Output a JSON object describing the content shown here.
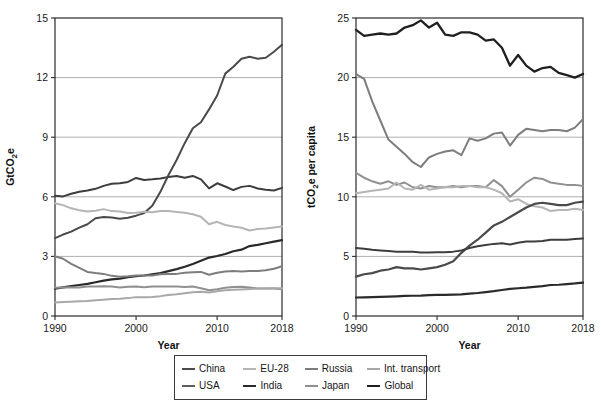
{
  "figure": {
    "background": "#ffffff",
    "panel_count": 2
  },
  "legend": {
    "position": "bottom-center",
    "rows": [
      [
        {
          "label": "China",
          "color": "#4a4a4a",
          "swatch": "line-swatch"
        },
        {
          "label": "EU-28",
          "color": "#b5b5b5",
          "swatch": "line-swatch"
        },
        {
          "label": "Russia",
          "color": "#7d7d7d",
          "swatch": "line-swatch"
        },
        {
          "label": "Int. transport",
          "color": "#a8a8a8",
          "swatch": "line-swatch"
        }
      ],
      [
        {
          "label": "USA",
          "color": "#5e5e5e",
          "swatch": "line-swatch"
        },
        {
          "label": "India",
          "color": "#2a2a2a",
          "swatch": "line-swatch"
        },
        {
          "label": "Japan",
          "color": "#909090",
          "swatch": "line-swatch"
        },
        {
          "label": "Global",
          "color": "#1e1e1e",
          "swatch": "line-swatch"
        }
      ]
    ]
  },
  "chart_data": [
    {
      "panel": "left",
      "type": "line",
      "title": "",
      "xlabel": "Year",
      "ylabel": "GtCO2e",
      "ylabel_display": "GtCO₂e",
      "xlim": [
        1990,
        2018
      ],
      "ylim": [
        0,
        15
      ],
      "yticks": [
        0,
        3,
        6,
        9,
        12,
        15
      ],
      "xticks": [
        1990,
        2000,
        2010,
        2018
      ],
      "grid": "horizontal",
      "legend_position": "below-figure",
      "x": [
        1990,
        1991,
        1992,
        1993,
        1994,
        1995,
        1996,
        1997,
        1998,
        1999,
        2000,
        2001,
        2002,
        2003,
        2004,
        2005,
        2006,
        2007,
        2008,
        2009,
        2010,
        2011,
        2012,
        2013,
        2014,
        2015,
        2016,
        2017,
        2018
      ],
      "series": [
        {
          "name": "USA",
          "color": "#3d3d3d",
          "width": 2.0,
          "values": [
            6.05,
            6.02,
            6.15,
            6.25,
            6.32,
            6.4,
            6.55,
            6.66,
            6.68,
            6.75,
            6.95,
            6.85,
            6.88,
            6.92,
            7.0,
            7.05,
            6.96,
            7.05,
            6.88,
            6.42,
            6.68,
            6.52,
            6.34,
            6.5,
            6.55,
            6.42,
            6.35,
            6.32,
            6.45
          ]
        },
        {
          "name": "China",
          "color": "#4a4a4a",
          "width": 2.0,
          "values": [
            3.92,
            4.1,
            4.25,
            4.45,
            4.62,
            4.92,
            4.98,
            4.96,
            4.9,
            4.95,
            5.05,
            5.18,
            5.55,
            6.25,
            7.1,
            7.85,
            8.7,
            9.45,
            9.75,
            10.4,
            11.1,
            12.2,
            12.55,
            12.95,
            13.05,
            12.95,
            13.0,
            13.3,
            13.65
          ]
        },
        {
          "name": "EU-28",
          "color": "#b5b5b5",
          "width": 2.0,
          "values": [
            5.68,
            5.58,
            5.42,
            5.32,
            5.26,
            5.3,
            5.38,
            5.28,
            5.26,
            5.18,
            5.2,
            5.25,
            5.22,
            5.28,
            5.28,
            5.24,
            5.2,
            5.12,
            5.0,
            4.62,
            4.74,
            4.58,
            4.5,
            4.44,
            4.3,
            4.38,
            4.4,
            4.46,
            4.5
          ]
        },
        {
          "name": "India",
          "color": "#2a2a2a",
          "width": 2.2,
          "values": [
            1.38,
            1.44,
            1.5,
            1.56,
            1.62,
            1.7,
            1.78,
            1.84,
            1.88,
            1.96,
            2.0,
            2.04,
            2.1,
            2.16,
            2.26,
            2.36,
            2.48,
            2.62,
            2.78,
            2.94,
            3.02,
            3.12,
            3.26,
            3.34,
            3.52,
            3.58,
            3.66,
            3.74,
            3.82
          ]
        },
        {
          "name": "Russia",
          "color": "#7d7d7d",
          "width": 2.0,
          "values": [
            3.0,
            2.88,
            2.62,
            2.42,
            2.22,
            2.16,
            2.12,
            2.02,
            1.98,
            2.0,
            2.04,
            2.04,
            2.04,
            2.1,
            2.12,
            2.12,
            2.18,
            2.2,
            2.22,
            2.08,
            2.18,
            2.24,
            2.26,
            2.24,
            2.26,
            2.26,
            2.3,
            2.38,
            2.5
          ]
        },
        {
          "name": "Japan",
          "color": "#909090",
          "width": 2.0,
          "values": [
            1.42,
            1.44,
            1.45,
            1.44,
            1.49,
            1.49,
            1.5,
            1.49,
            1.44,
            1.47,
            1.48,
            1.45,
            1.48,
            1.49,
            1.48,
            1.48,
            1.46,
            1.48,
            1.4,
            1.3,
            1.35,
            1.42,
            1.46,
            1.47,
            1.43,
            1.39,
            1.38,
            1.38,
            1.35
          ]
        },
        {
          "name": "Int. transport",
          "color": "#a8a8a8",
          "width": 2.0,
          "values": [
            0.68,
            0.7,
            0.72,
            0.74,
            0.76,
            0.79,
            0.82,
            0.85,
            0.87,
            0.9,
            0.95,
            0.94,
            0.96,
            1.0,
            1.06,
            1.1,
            1.15,
            1.2,
            1.22,
            1.18,
            1.25,
            1.3,
            1.32,
            1.34,
            1.36,
            1.38,
            1.39,
            1.4,
            1.4
          ]
        }
      ]
    },
    {
      "panel": "right",
      "type": "line",
      "title": "",
      "xlabel": "Year",
      "ylabel": "tCO2e per capita",
      "ylabel_display": "tCO₂e per capita",
      "xlim": [
        1990,
        2018
      ],
      "ylim": [
        0,
        25
      ],
      "yticks": [
        0,
        5,
        10,
        15,
        20,
        25
      ],
      "xticks": [
        1990,
        2000,
        2010,
        2018
      ],
      "grid": "horizontal",
      "legend_position": "below-figure",
      "x": [
        1990,
        1991,
        1992,
        1993,
        1994,
        1995,
        1996,
        1997,
        1998,
        1999,
        2000,
        2001,
        2002,
        2003,
        2004,
        2005,
        2006,
        2007,
        2008,
        2009,
        2010,
        2011,
        2012,
        2013,
        2014,
        2015,
        2016,
        2017,
        2018
      ],
      "series": [
        {
          "name": "USA",
          "color": "#1f1f1f",
          "width": 2.3,
          "values": [
            24.0,
            23.5,
            23.6,
            23.7,
            23.6,
            23.7,
            24.2,
            24.4,
            24.8,
            24.2,
            24.6,
            23.6,
            23.5,
            23.8,
            23.8,
            23.6,
            23.1,
            23.2,
            22.5,
            21.0,
            21.9,
            21.0,
            20.5,
            20.8,
            20.9,
            20.4,
            20.2,
            20.0,
            20.3
          ]
        },
        {
          "name": "Russia",
          "color": "#7d7d7d",
          "width": 2.0,
          "values": [
            20.3,
            19.9,
            18.0,
            16.4,
            14.8,
            14.2,
            13.6,
            12.9,
            12.5,
            13.3,
            13.6,
            13.8,
            13.9,
            13.5,
            14.9,
            14.7,
            14.9,
            15.3,
            15.4,
            14.3,
            15.2,
            15.7,
            15.6,
            15.5,
            15.6,
            15.6,
            15.5,
            15.8,
            16.5
          ]
        },
        {
          "name": "Japan",
          "color": "#909090",
          "width": 2.0,
          "values": [
            12.0,
            11.6,
            11.3,
            11.1,
            11.3,
            11.0,
            11.2,
            10.8,
            10.7,
            10.9,
            10.8,
            10.8,
            10.9,
            10.8,
            10.9,
            10.9,
            10.8,
            11.4,
            10.9,
            10.0,
            10.6,
            11.2,
            11.6,
            11.5,
            11.2,
            11.1,
            11.0,
            11.0,
            10.9
          ]
        },
        {
          "name": "EU-28",
          "color": "#b5b5b5",
          "width": 2.0,
          "values": [
            10.3,
            10.4,
            10.5,
            10.6,
            10.7,
            11.2,
            10.7,
            10.6,
            11.0,
            10.6,
            10.7,
            10.8,
            10.8,
            10.9,
            10.9,
            10.8,
            10.8,
            10.6,
            10.3,
            9.6,
            9.8,
            9.4,
            9.2,
            9.1,
            8.8,
            8.9,
            8.9,
            9.0,
            8.9
          ]
        },
        {
          "name": "China",
          "color": "#4a4a4a",
          "width": 2.2,
          "values": [
            3.3,
            3.5,
            3.6,
            3.8,
            3.9,
            4.1,
            4.0,
            4.0,
            3.9,
            4.0,
            4.1,
            4.3,
            4.6,
            5.3,
            5.9,
            6.4,
            7.0,
            7.6,
            7.9,
            8.3,
            8.7,
            9.1,
            9.4,
            9.5,
            9.4,
            9.3,
            9.3,
            9.5,
            9.6
          ]
        },
        {
          "name": "Global",
          "color": "#3d3d3d",
          "width": 2.0,
          "values": [
            5.7,
            5.65,
            5.55,
            5.5,
            5.45,
            5.4,
            5.4,
            5.38,
            5.32,
            5.32,
            5.35,
            5.35,
            5.4,
            5.5,
            5.7,
            5.85,
            5.95,
            6.05,
            6.1,
            6.0,
            6.15,
            6.25,
            6.25,
            6.3,
            6.4,
            6.4,
            6.4,
            6.45,
            6.5
          ]
        },
        {
          "name": "India",
          "color": "#2a2a2a",
          "width": 2.2,
          "values": [
            1.55,
            1.57,
            1.58,
            1.6,
            1.62,
            1.65,
            1.68,
            1.7,
            1.71,
            1.75,
            1.77,
            1.78,
            1.8,
            1.82,
            1.88,
            1.93,
            2.0,
            2.08,
            2.18,
            2.28,
            2.33,
            2.38,
            2.45,
            2.5,
            2.6,
            2.62,
            2.68,
            2.73,
            2.8
          ]
        }
      ]
    }
  ]
}
